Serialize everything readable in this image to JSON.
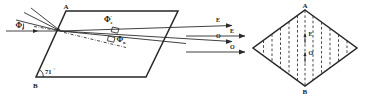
{
  "figure": {
    "background_color": "#ffffff",
    "ink_color": "#262626"
  },
  "left_diagram": {
    "name": "nicol-prism-side-view",
    "shape": "parallelogram",
    "vertices": {
      "top_left_label": "A",
      "bottom_left_label": "B"
    },
    "angles": [
      {
        "label": "71",
        "degree_symbol": "°",
        "at": "bottom-left-corner"
      }
    ],
    "incident_angle_label": {
      "symbol": "Φ",
      "subscript": "i",
      "prime": ""
    },
    "internal_angle_labels": [
      {
        "symbol": "Φ",
        "prime": "'",
        "subscript": "e"
      },
      {
        "symbol": "Φ",
        "prime": "'",
        "subscript": "o"
      }
    ],
    "exit_ray_labels": [
      {
        "label": "E"
      },
      {
        "label": "O"
      }
    ]
  },
  "right_diagram": {
    "name": "nicol-prism-end-view",
    "shape": "rhombus",
    "vertices": {
      "top_label": "A",
      "bottom_label": "B"
    },
    "interior_lines": "vertical dashed optic-axis traces",
    "vector_labels": [
      {
        "label": "E",
        "direction": "up"
      },
      {
        "label": "O",
        "direction": "up"
      }
    ],
    "incoming_ray_labels": [
      {
        "label": "E"
      },
      {
        "label": "O"
      }
    ]
  }
}
